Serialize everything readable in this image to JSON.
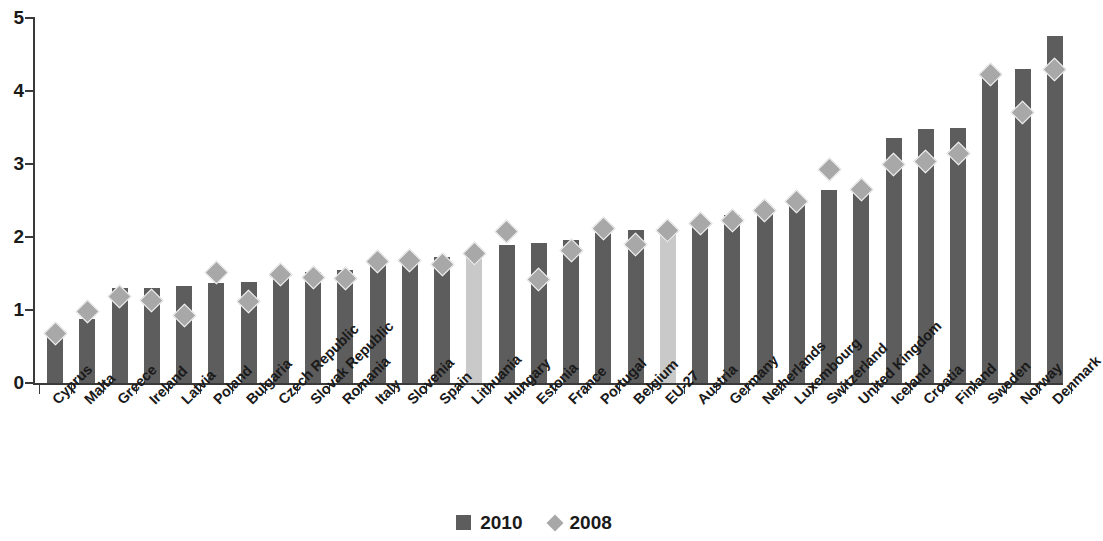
{
  "chart_data": {
    "type": "bar",
    "title": "",
    "subtitle": "",
    "xlabel": "",
    "ylabel": "",
    "ylim": [
      0,
      5
    ],
    "ytick_labels": [
      "0",
      "1",
      "2",
      "3",
      "4",
      "5"
    ],
    "ytick_values": [
      0,
      1,
      2,
      3,
      4,
      5
    ],
    "grid": false,
    "legend_position": "bottom-center",
    "categories": [
      "Cyprus",
      "Malta",
      "Greece",
      "Ireland",
      "Latvia",
      "Poland",
      "Bulgaria",
      "Czech Republic",
      "Slovak Republic",
      "Romania",
      "Italy",
      "Slovenia",
      "Spain",
      "Lithuania",
      "Hungary",
      "Estonia",
      "France",
      "Portugal",
      "Belgium",
      "EU-27",
      "Austria",
      "Germany",
      "Netherlands",
      "Luxembourg",
      "Switzerland",
      "United Kingdom",
      "Iceland",
      "Croatia",
      "Finland",
      "Sweden",
      "Norway",
      "Denmark"
    ],
    "series": [
      {
        "name": "2010",
        "marker": "bar",
        "color": "#5d5d5d",
        "highlight_color": "#c9c9c9",
        "highlighted_categories": [
          "Lithuania",
          "EU-27"
        ],
        "values": [
          0.64,
          0.87,
          1.3,
          1.3,
          1.33,
          1.37,
          1.39,
          1.48,
          1.52,
          1.55,
          1.62,
          1.67,
          1.72,
          1.78,
          1.89,
          1.92,
          1.96,
          2.06,
          2.09,
          2.13,
          2.16,
          2.3,
          2.38,
          2.44,
          2.64,
          2.6,
          3.36,
          3.48,
          3.5,
          4.18,
          4.3,
          4.75
        ]
      },
      {
        "name": "2008",
        "marker": "diamond",
        "color": "#a8a8a8",
        "values": [
          0.68,
          0.98,
          1.18,
          1.13,
          0.92,
          1.51,
          1.12,
          1.49,
          1.45,
          1.43,
          1.66,
          1.68,
          1.63,
          1.78,
          2.07,
          1.42,
          1.81,
          2.12,
          1.9,
          2.09,
          2.19,
          2.23,
          2.36,
          2.49,
          2.93,
          2.65,
          2.99,
          3.04,
          3.15,
          4.22,
          3.7,
          4.3
        ]
      }
    ]
  },
  "legend": {
    "items": [
      {
        "label": "2010",
        "swatch": "square-icon"
      },
      {
        "label": "2008",
        "swatch": "diamond-icon"
      }
    ]
  }
}
